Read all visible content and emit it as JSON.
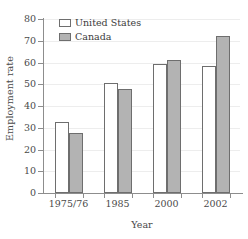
{
  "chart_data": {
    "type": "bar",
    "title": "",
    "subtitle": "",
    "xlabel": "Year",
    "ylabel": "Employment rate",
    "categories": [
      "1975/76",
      "1985",
      "2000",
      "2002"
    ],
    "series": [
      {
        "name": "United States",
        "color": "#ffffff",
        "values": [
          32.7,
          50.8,
          59.2,
          58.3
        ]
      },
      {
        "name": "Canada",
        "color": "#b3b3b3",
        "values": [
          27.8,
          48.0,
          61.2,
          72.3
        ]
      }
    ],
    "ylim": [
      0,
      80
    ],
    "ytick_step": 10,
    "yticks": [
      0,
      10,
      20,
      30,
      40,
      50,
      60,
      70,
      80
    ],
    "ytick_labels": [
      "0",
      "10",
      "20",
      "30",
      "40",
      "50",
      "60",
      "70",
      "80"
    ],
    "grid": "horizontal",
    "grid_color": "#ededed",
    "legend_position": "top-left",
    "axis_frame": "left-bottom",
    "bar_border_color": "#6e6e6e",
    "axis_color": "#8d8d8d",
    "annotations": []
  },
  "legend": {
    "items": [
      {
        "label": "United States",
        "swatch": "legend-swatch-united-states"
      },
      {
        "label": "Canada",
        "swatch": "legend-swatch-canada"
      }
    ]
  }
}
